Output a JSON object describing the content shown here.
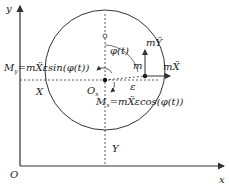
{
  "diagram": {
    "axes": {
      "y_label": "y",
      "x_label": "x",
      "origin_label": "O"
    },
    "labels": {
      "my_label": "M",
      "my_sub": "y",
      "my_expr": "=mẌεsin(φ(t))",
      "mx_label": "M",
      "mx_sub": "x",
      "mx_expr": "=mẌεcos(φ(t))",
      "X": "X",
      "Y": "Y",
      "center": "O",
      "center_sub": "x",
      "phi": "φ(t)",
      "mass": "m",
      "eccentricity": "ε",
      "force_y": "mŸ",
      "force_x": "mẌ"
    },
    "colors": {
      "stroke": "#333333",
      "background": "#ffffff"
    }
  }
}
